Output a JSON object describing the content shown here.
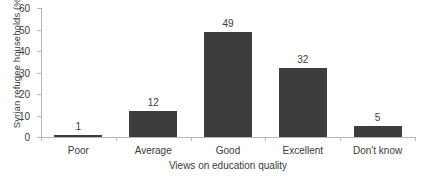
{
  "chart_data": {
    "type": "bar",
    "title": "",
    "categories": [
      "Poor",
      "Average",
      "Good",
      "Excellent",
      "Don't know"
    ],
    "values": [
      1,
      12,
      49,
      32,
      5
    ],
    "value_labels": [
      "1",
      "12",
      "49",
      "32",
      "5"
    ],
    "xlabel": "Views on education quality",
    "ylabel": "Syrian refugee households (%)",
    "ylim": [
      0,
      60
    ],
    "ytick_labels": [
      "0",
      "10",
      "20",
      "30",
      "40",
      "50",
      "60"
    ],
    "ytick_values": [
      0,
      10,
      20,
      30,
      40,
      50,
      60
    ],
    "grid": false,
    "legend": null,
    "bar_color": "#3d3d3d",
    "axis_color": "#b9b9b9",
    "text_color": "#3a3a3a",
    "background": "#ffffff"
  }
}
